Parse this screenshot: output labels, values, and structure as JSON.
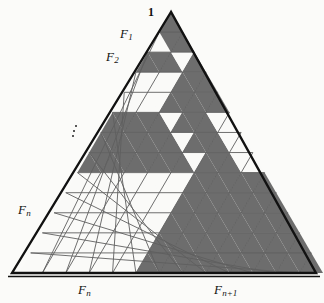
{
  "figure": {
    "colors": {
      "background": "#fbfbf9",
      "shaded_fill": "#6d6d6d",
      "light_fill": "#fafaf8",
      "grid_stroke": "#5f5f5f",
      "outline_stroke": "#111111",
      "text": "#111111"
    },
    "geometry": {
      "rows": 13,
      "apex_x": 171,
      "apex_y": 12,
      "left_x": 12,
      "right_x": 316,
      "base_y": 273
    },
    "labels": [
      {
        "name": "apex-label-one",
        "text": "1",
        "sub": "",
        "x": 148,
        "y": 6,
        "italic": false
      },
      {
        "name": "label-f1",
        "text": "F",
        "sub": "1",
        "x": 120,
        "y": 27,
        "italic": true
      },
      {
        "name": "label-f2",
        "text": "F",
        "sub": "2",
        "x": 106,
        "y": 50,
        "italic": true
      },
      {
        "name": "label-fn-left",
        "text": "F",
        "sub": "n",
        "x": 18,
        "y": 203,
        "italic": true
      },
      {
        "name": "label-fn-bottom",
        "text": "F",
        "sub": "n",
        "x": 78,
        "y": 283,
        "italic": true
      },
      {
        "name": "label-fnplus1-bottom",
        "text": "F",
        "sub": "n+1",
        "x": 214,
        "y": 283,
        "italic": true
      }
    ],
    "ellipsis": {
      "name": "vertical-ellipsis",
      "x": 72,
      "y": 125,
      "glyph": "vertical-dots"
    },
    "shaded_blocks": [
      {
        "name": "block-apex",
        "row": 0,
        "col": 0,
        "size": 1,
        "note": "apex unit triangle = 1"
      },
      {
        "name": "block-f1",
        "row": 1,
        "col": 1,
        "size": 1,
        "note": "F1 = 1"
      },
      {
        "name": "block-f2",
        "row": 2,
        "col": 0,
        "size": 1,
        "note": "F2 block left"
      },
      {
        "name": "block-f2b",
        "row": 3,
        "col": 2,
        "size": 2,
        "note": "F2 = 1 region"
      },
      {
        "name": "block-middle",
        "row": 5,
        "col": 0,
        "size": 3,
        "note": "F_n-1 block"
      },
      {
        "name": "block-right",
        "row": 5,
        "col": 4,
        "size": 3,
        "note": "right column block"
      },
      {
        "name": "block-fn1",
        "row": 8,
        "col": 5,
        "size": 5,
        "note": "F_n+1 = 5 block lower right"
      }
    ],
    "shaded_row_spans": [
      {
        "row": 0,
        "start": 0,
        "end": 1
      },
      {
        "row": 1,
        "start": 1,
        "end": 3
      },
      {
        "row": 2,
        "start": 0,
        "end": 3
      },
      {
        "row": 2,
        "start": 4,
        "end": 5
      },
      {
        "row": 3,
        "start": 4,
        "end": 7
      },
      {
        "row": 4,
        "start": 4,
        "end": 9
      },
      {
        "row": 5,
        "start": 0,
        "end": 5
      },
      {
        "row": 5,
        "start": 6,
        "end": 9
      },
      {
        "row": 6,
        "start": 0,
        "end": 7
      },
      {
        "row": 6,
        "start": 8,
        "end": 11
      },
      {
        "row": 7,
        "start": 0,
        "end": 9
      },
      {
        "row": 7,
        "start": 10,
        "end": 13
      },
      {
        "row": 8,
        "start": 10,
        "end": 17
      },
      {
        "row": 9,
        "start": 10,
        "end": 19
      },
      {
        "row": 10,
        "start": 10,
        "end": 21
      },
      {
        "row": 11,
        "start": 10,
        "end": 23
      },
      {
        "row": 12,
        "start": 10,
        "end": 25
      }
    ]
  }
}
